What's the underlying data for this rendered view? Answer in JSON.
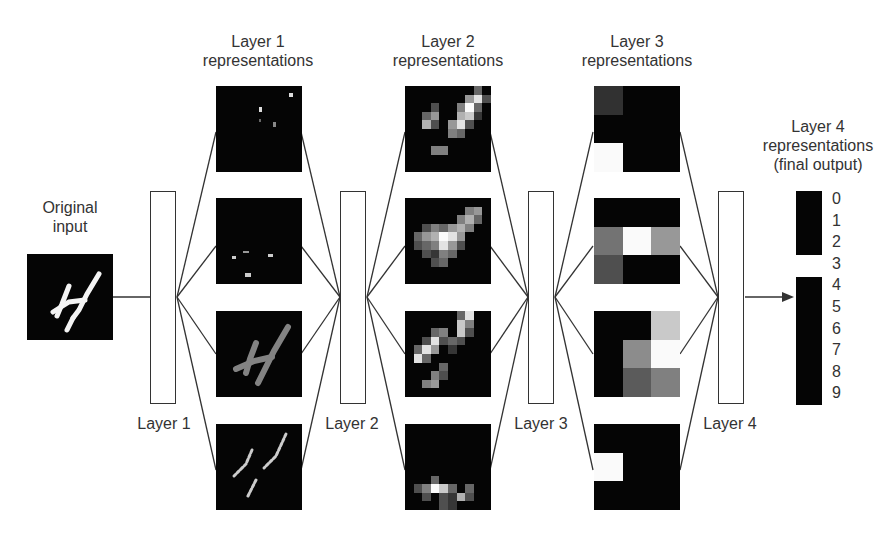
{
  "input": {
    "label_line1": "Original",
    "label_line2": "input"
  },
  "layers": [
    {
      "name": "Layer 1",
      "title_line1": "Layer 1",
      "title_line2": "representations"
    },
    {
      "name": "Layer 2",
      "title_line1": "Layer 2",
      "title_line2": "representations"
    },
    {
      "name": "Layer 3",
      "title_line1": "Layer 3",
      "title_line2": "representations"
    },
    {
      "name": "Layer 4",
      "title_line1": "Layer 4",
      "title_line2": "representations",
      "title_line3": "(final output)"
    }
  ],
  "output": {
    "classes": [
      "0",
      "1",
      "2",
      "3",
      "4",
      "5",
      "6",
      "7",
      "8",
      "9"
    ],
    "activations": [
      0,
      0,
      0,
      1,
      0,
      0,
      0,
      0,
      0,
      0
    ],
    "predicted_label": "4"
  },
  "layer2_maps": [
    [
      0,
      0,
      0,
      0,
      0,
      0,
      0,
      0,
      0.4,
      0,
      0,
      0,
      0,
      0,
      0,
      0,
      0,
      0.6,
      0.9,
      0.3,
      0,
      0,
      0,
      0.3,
      0,
      0,
      0.5,
      1,
      0.4,
      0,
      0,
      0,
      0.4,
      0.6,
      0,
      0,
      0.7,
      0.8,
      0.2,
      0,
      0,
      0,
      0.7,
      0.3,
      0,
      0.6,
      0.9,
      0.3,
      0,
      0,
      0,
      0,
      0,
      0,
      0,
      0.5,
      0.4,
      0,
      0,
      0,
      0,
      0,
      0,
      0,
      0,
      0,
      0,
      0,
      0,
      0,
      0,
      0,
      0,
      0.5,
      0.5,
      0,
      0,
      0,
      0,
      0,
      0,
      0,
      0,
      0,
      0,
      0,
      0,
      0,
      0,
      0,
      0,
      0,
      0,
      0,
      0,
      0,
      0,
      0,
      0,
      0
    ],
    [
      0,
      0,
      0,
      0,
      0,
      0,
      0,
      0,
      0,
      0,
      0,
      0,
      0,
      0,
      0,
      0,
      0,
      0.5,
      0.6,
      0,
      0,
      0,
      0,
      0,
      0,
      0,
      0.5,
      0.7,
      0.4,
      0,
      0,
      0,
      0.3,
      0.5,
      0.4,
      0.6,
      0.7,
      0.5,
      0,
      0,
      0,
      0.4,
      0.6,
      0.7,
      1,
      0.9,
      0.6,
      0,
      0,
      0,
      0,
      0.3,
      0.4,
      0.5,
      0.9,
      0.6,
      0.3,
      0,
      0,
      0,
      0,
      0,
      0.3,
      0.2,
      0.5,
      0.4,
      0,
      0,
      0,
      0,
      0,
      0,
      0,
      0.3,
      0.4,
      0,
      0,
      0,
      0,
      0,
      0,
      0,
      0,
      0,
      0,
      0,
      0,
      0,
      0,
      0,
      0,
      0,
      0,
      0,
      0,
      0,
      0,
      0,
      0,
      0
    ],
    [
      0,
      0,
      0,
      0,
      0,
      0,
      0.4,
      0.9,
      0,
      0,
      0,
      0,
      0,
      0,
      0,
      0,
      0.8,
      0.5,
      0,
      0,
      0,
      0,
      0,
      0.4,
      0.5,
      0,
      0.8,
      0.3,
      0,
      0,
      0,
      0,
      0.3,
      0.9,
      0.3,
      0.4,
      0.3,
      0,
      0,
      0,
      0,
      0.4,
      0.9,
      0.6,
      0,
      0.2,
      0,
      0,
      0,
      0,
      0,
      0.9,
      0.4,
      0,
      0,
      0,
      0,
      0,
      0,
      0,
      0,
      0,
      0,
      0,
      0.4,
      0,
      0,
      0,
      0,
      0,
      0,
      0,
      0,
      0.5,
      0.3,
      0,
      0,
      0,
      0,
      0,
      0,
      0,
      0.5,
      0.6,
      0,
      0,
      0,
      0,
      0,
      0,
      0,
      0,
      0,
      0,
      0,
      0,
      0,
      0,
      0,
      0
    ],
    [
      0,
      0,
      0,
      0,
      0,
      0,
      0,
      0,
      0,
      0,
      0,
      0,
      0,
      0,
      0,
      0,
      0,
      0,
      0,
      0,
      0,
      0,
      0,
      0,
      0,
      0,
      0,
      0,
      0,
      0,
      0,
      0,
      0,
      0,
      0,
      0,
      0,
      0,
      0,
      0,
      0,
      0,
      0,
      0,
      0,
      0,
      0,
      0,
      0,
      0,
      0,
      0,
      0,
      0,
      0,
      0,
      0,
      0,
      0,
      0,
      0,
      0,
      0,
      0.4,
      0,
      0,
      0,
      0,
      0,
      0,
      0,
      0.3,
      0.5,
      1,
      0.8,
      0.4,
      0,
      0.4,
      0,
      0,
      0,
      0,
      0.3,
      0,
      0.3,
      0.2,
      0.7,
      0.3,
      0,
      0,
      0,
      0,
      0,
      0,
      0.3,
      0.2,
      0,
      0,
      0,
      0
    ]
  ],
  "layer3_maps": [
    [
      0.18,
      0,
      0,
      0,
      0,
      0,
      1,
      0,
      0
    ],
    [
      0,
      0,
      0,
      0.45,
      1,
      0.6,
      0.3,
      0,
      0
    ],
    [
      0,
      0,
      0.8,
      0,
      0.55,
      1,
      0,
      0.35,
      0.5
    ],
    [
      0,
      0,
      0,
      1,
      0,
      0,
      0,
      0,
      0
    ]
  ],
  "colors": {
    "line": "#333333",
    "tile_bg": "#050505",
    "background": "#ffffff"
  }
}
